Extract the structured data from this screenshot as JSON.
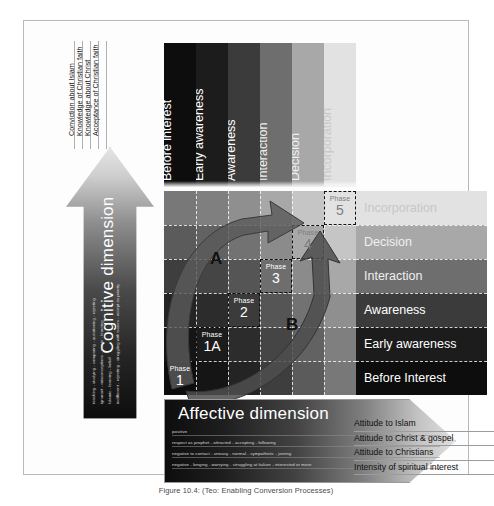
{
  "caption": "Figure 10.4: (Teo: Enabling Conversion Processes)",
  "cognitive": {
    "title": "Cognitive dimension",
    "sub_scales": [
      "teaching - studying - comparing - questioning - rejecting",
      "ignorant - misconceptions - aware - learning",
      "Islamic - learning - belief",
      "indifferent - rejecting - struggling with issues - accept as priority"
    ],
    "labels": [
      "Conviction about Islam",
      "Knowledge of Christian faith",
      "Knowledge about Christ",
      "Acceptance of Christian faith"
    ]
  },
  "affective": {
    "title": "Affective dimension",
    "sub_scales": [
      {
        "left": "positive",
        "right": "hostile"
      },
      {
        "left": "respect as prophet - attracted - accepting - following",
        "right": ""
      },
      {
        "left": "negative to contact - uneasy - normal - sympathetic - joining",
        "right": ""
      },
      {
        "left": "negative - longing - worrying - struggling at failure - interested or more",
        "right": ""
      }
    ],
    "labels": [
      "Attitude to Islam",
      "Attitude to Christ & gospel",
      "Attitude to Christians",
      "Intensity of spiritual interest"
    ]
  },
  "chart_data": {
    "type": "heatmap",
    "title": "Enabling Conversion Processes",
    "xlabel": "Affective dimension",
    "ylabel": "Cognitive dimension",
    "columns": [
      "Before interest",
      "Early awareness",
      "Awareness",
      "Interaction",
      "Decision",
      "Incorporation"
    ],
    "rows": [
      "Before Interest",
      "Early awareness",
      "Awareness",
      "Interaction",
      "Decision",
      "Incorporation"
    ],
    "column_shades": [
      "#0d0d0d",
      "#1c1c1c",
      "#3b3b3b",
      "#6e6e6e",
      "#a8a8a8",
      "#e2e2e2"
    ],
    "row_shades": [
      "#0d0d0d",
      "#1c1c1c",
      "#3b3b3b",
      "#6e6e6e",
      "#a8a8a8",
      "#e2e2e2"
    ],
    "grid": true,
    "legend": "none",
    "phases": [
      {
        "word": "Phase",
        "number": "1",
        "col": 0,
        "row": 0
      },
      {
        "word": "Phase",
        "number": "1A",
        "col": 1,
        "row": 1
      },
      {
        "word": "Phase",
        "number": "2",
        "col": 2,
        "row": 2
      },
      {
        "word": "Phase",
        "number": "3",
        "col": 3,
        "row": 3
      },
      {
        "word": "Phase",
        "number": "4",
        "col": 4,
        "row": 4
      },
      {
        "word": "Phase",
        "number": "5",
        "col": 5,
        "row": 5
      }
    ],
    "arrows": [
      {
        "label": "A",
        "from": "Phase 1",
        "to": "Phase 4",
        "path": "cognitive-leading"
      },
      {
        "label": "B",
        "from": "Phase 1",
        "to": "Phase 5",
        "path": "affective-leading"
      }
    ]
  }
}
